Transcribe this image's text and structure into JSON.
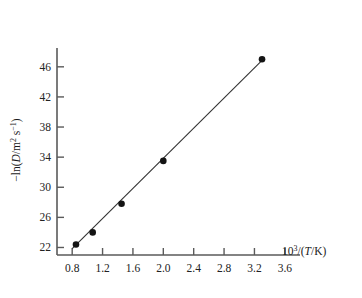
{
  "chart_data": {
    "type": "scatter",
    "title": "",
    "subtitle": "",
    "xlabel": "10^3/(T/K)",
    "ylabel": "-ln(D/m^2 s^-1)",
    "xlim": [
      0.6,
      3.8
    ],
    "ylim": [
      21.0,
      48.5
    ],
    "grid": false,
    "legend": null,
    "xticks": [
      "0.8",
      "1.2",
      "1.6",
      "2.0",
      "2.4",
      "2.8",
      "3.2",
      "3.6"
    ],
    "xtick_values": [
      0.8,
      1.2,
      1.6,
      2.0,
      2.4,
      2.8,
      3.2,
      3.6
    ],
    "yticks": [
      "22",
      "26",
      "30",
      "34",
      "38",
      "42",
      "46"
    ],
    "ytick_values": [
      22,
      26,
      30,
      34,
      38,
      42,
      46
    ],
    "series": [
      {
        "name": "diffusion data",
        "marker": "filled-circle",
        "line": "best-fit straight line",
        "color": "#141414",
        "x": [
          0.85,
          1.07,
          1.45,
          2.0,
          3.3
        ],
        "y": [
          22.4,
          24.0,
          27.8,
          33.5,
          47.0
        ]
      }
    ],
    "fit_line": {
      "x": [
        0.8,
        3.32
      ],
      "y": [
        21.85,
        47.05
      ]
    },
    "annotations": []
  },
  "axis_labels": {
    "y_parts": {
      "minus": "−ln(",
      "d": "D",
      "slash": "/m",
      "sup2": "2",
      "space_s": " s",
      "supm1": "−1",
      "close": ")"
    },
    "x_parts": {
      "ten": "10",
      "exp": "3",
      "rest": "/(",
      "t": "T",
      "k": "/K)"
    }
  }
}
